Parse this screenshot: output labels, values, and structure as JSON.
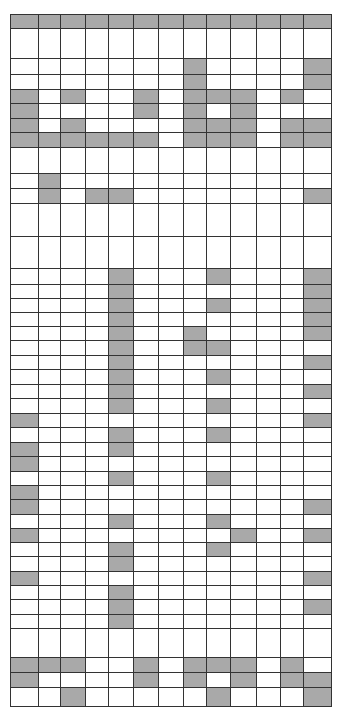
{
  "colors": {
    "filled": "#a9a9a9",
    "empty": "#ffffff",
    "line": "#333333"
  },
  "grid": {
    "columns": 13,
    "column_widths": [
      28,
      22,
      25,
      23,
      25,
      25,
      25,
      23,
      24,
      26,
      24,
      23,
      28
    ],
    "rows": [
      {
        "h": 14,
        "filled": [
          0,
          1,
          2,
          3,
          4,
          5,
          6,
          7,
          8,
          9,
          10,
          11,
          12
        ]
      },
      {
        "h": 30,
        "filled": []
      },
      {
        "h": 16,
        "filled": [
          7,
          12
        ]
      },
      {
        "h": 15,
        "filled": [
          7,
          12
        ]
      },
      {
        "h": 14,
        "filled": [
          0,
          2,
          5,
          7,
          8,
          9,
          11
        ]
      },
      {
        "h": 15,
        "filled": [
          0,
          5,
          7,
          9
        ]
      },
      {
        "h": 14,
        "filled": [
          0,
          2,
          7,
          8,
          9,
          11,
          12
        ]
      },
      {
        "h": 15,
        "filled": [
          0,
          1,
          2,
          3,
          4,
          5,
          7,
          8,
          9,
          11,
          12
        ]
      },
      {
        "h": 26,
        "filled": []
      },
      {
        "h": 15,
        "filled": [
          1
        ]
      },
      {
        "h": 15,
        "filled": [
          1,
          3,
          4,
          12
        ]
      },
      {
        "h": 33,
        "filled": []
      },
      {
        "h": 32,
        "filled": []
      },
      {
        "h": 16,
        "filled": [
          4,
          8,
          12
        ]
      },
      {
        "h": 14,
        "filled": [
          4,
          12
        ]
      },
      {
        "h": 14,
        "filled": [
          4,
          8,
          12
        ]
      },
      {
        "h": 14,
        "filled": [
          4,
          12
        ]
      },
      {
        "h": 14,
        "filled": [
          4,
          7,
          12
        ]
      },
      {
        "h": 15,
        "filled": [
          4,
          7,
          8
        ]
      },
      {
        "h": 14,
        "filled": [
          4,
          12
        ]
      },
      {
        "h": 15,
        "filled": [
          4,
          8
        ]
      },
      {
        "h": 14,
        "filled": [
          4,
          12
        ]
      },
      {
        "h": 15,
        "filled": [
          4,
          8
        ]
      },
      {
        "h": 14,
        "filled": [
          0,
          12
        ]
      },
      {
        "h": 15,
        "filled": [
          4,
          8
        ]
      },
      {
        "h": 14,
        "filled": [
          0,
          4
        ]
      },
      {
        "h": 15,
        "filled": [
          0
        ]
      },
      {
        "h": 14,
        "filled": [
          4,
          8
        ]
      },
      {
        "h": 14,
        "filled": [
          0
        ]
      },
      {
        "h": 15,
        "filled": [
          0,
          12
        ]
      },
      {
        "h": 14,
        "filled": [
          4,
          8
        ]
      },
      {
        "h": 14,
        "filled": [
          0,
          9,
          12
        ]
      },
      {
        "h": 14,
        "filled": [
          4,
          8
        ]
      },
      {
        "h": 15,
        "filled": [
          4
        ]
      },
      {
        "h": 14,
        "filled": [
          0,
          12
        ]
      },
      {
        "h": 14,
        "filled": [
          4
        ]
      },
      {
        "h": 15,
        "filled": [
          4,
          12
        ]
      },
      {
        "h": 14,
        "filled": [
          4
        ]
      },
      {
        "h": 29,
        "filled": []
      },
      {
        "h": 15,
        "filled": [
          0,
          1,
          2,
          5,
          7,
          8,
          9,
          11
        ]
      },
      {
        "h": 15,
        "filled": [
          0,
          5,
          7,
          9,
          11,
          12
        ]
      },
      {
        "h": 19,
        "filled": [
          2,
          8,
          12
        ]
      }
    ]
  }
}
